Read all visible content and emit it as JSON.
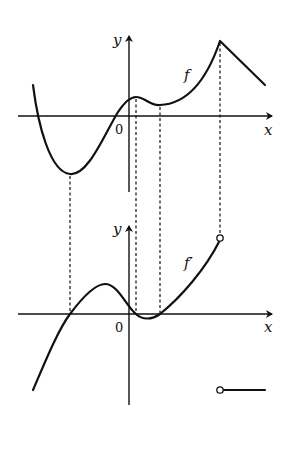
{
  "diagram": {
    "top_graph": {
      "function_label": "f",
      "x_axis_label": "x",
      "y_axis_label": "y",
      "origin_label": "0"
    },
    "bottom_graph": {
      "function_label": "f′",
      "x_axis_label": "x",
      "y_axis_label": "y",
      "origin_label": "0"
    },
    "colors": {
      "ink": "#111111",
      "background": "#ffffff"
    }
  }
}
